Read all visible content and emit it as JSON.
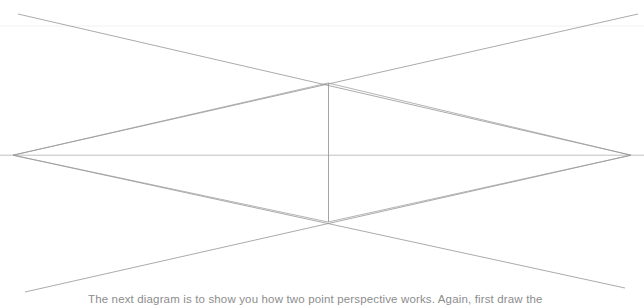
{
  "page": {
    "background_color": "#ffffff",
    "width": 644,
    "height": 305
  },
  "diagram": {
    "name": "two-point-perspective",
    "stroke_color": "#9a9a9a",
    "faint_stroke_color": "#e2e2e2",
    "stroke_width": 0.7,
    "vanishing_points": {
      "left": {
        "label": "left-vanishing-point",
        "x": 14,
        "y": 155
      },
      "right": {
        "label": "right-vanishing-point",
        "x": 630,
        "y": 155
      }
    },
    "horizon_line": {
      "label": "horizon-line",
      "x1": 0,
      "y1": 155,
      "x2": 644,
      "y2": 155
    },
    "faint_upper_guide": {
      "label": "faint-upper-guide-line",
      "x1": 0,
      "y1": 26,
      "x2": 644,
      "y2": 26
    },
    "vertical_edge": {
      "label": "near-corner-vertical",
      "x": 328,
      "y_top": 83,
      "y_bottom": 222
    },
    "crossings": {
      "upper": {
        "label": "upper-crossing-point",
        "x": 328,
        "y": 83
      },
      "lower": {
        "label": "lower-crossing-point",
        "x": 328,
        "y": 222
      }
    },
    "converging_lines": [
      {
        "name": "top-left-to-right-vp",
        "x1": 18,
        "y1": 14,
        "x2": 630,
        "y2": 155
      },
      {
        "name": "top-right-to-left-vp",
        "x1": 638,
        "y1": 14,
        "x2": 14,
        "y2": 155
      },
      {
        "name": "bottom-left-to-right-vp",
        "x1": 25,
        "y1": 292,
        "x2": 630,
        "y2": 155
      },
      {
        "name": "bottom-right-to-left-vp",
        "x1": 625,
        "y1": 288,
        "x2": 14,
        "y2": 155
      },
      {
        "name": "upper-corner-to-left-vp",
        "x1": 328,
        "y1": 83,
        "x2": 14,
        "y2": 155
      },
      {
        "name": "upper-corner-to-right-vp",
        "x1": 328,
        "y1": 83,
        "x2": 630,
        "y2": 155
      },
      {
        "name": "lower-corner-to-left-vp",
        "x1": 328,
        "y1": 222,
        "x2": 14,
        "y2": 155
      },
      {
        "name": "lower-corner-to-right-vp",
        "x1": 328,
        "y1": 222,
        "x2": 630,
        "y2": 155
      }
    ]
  },
  "caption": {
    "text": "The next diagram is to show you how two point perspective works. Again, first draw the"
  }
}
